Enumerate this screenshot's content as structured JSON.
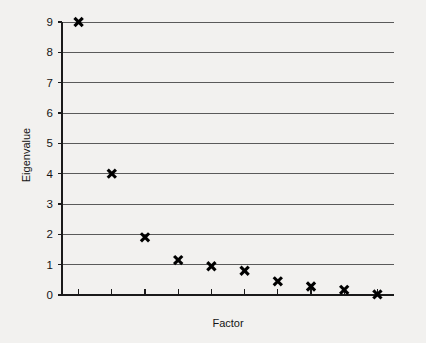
{
  "chart_data": {
    "type": "scatter",
    "title": "",
    "xlabel": "Factor",
    "ylabel": "Eigenvalue",
    "x": [
      1,
      2,
      3,
      4,
      5,
      6,
      7,
      8,
      9,
      10
    ],
    "values": [
      9.0,
      4.0,
      1.9,
      1.15,
      0.95,
      0.8,
      0.45,
      0.28,
      0.17,
      0.02
    ],
    "series": [
      {
        "name": "Eigenvalue",
        "values": [
          9.0,
          4.0,
          1.9,
          1.15,
          0.95,
          0.8,
          0.45,
          0.28,
          0.17,
          0.02
        ]
      }
    ],
    "ylim": [
      0,
      9
    ],
    "xlim": [
      0.5,
      10.5
    ],
    "ytick_labels": [
      "0",
      "1",
      "2",
      "3",
      "4",
      "5",
      "6",
      "7",
      "8",
      "9"
    ],
    "ytick_values": [
      0,
      1,
      2,
      3,
      4,
      5,
      6,
      7,
      8,
      9
    ],
    "xtick_labels": [
      "",
      "",
      "",
      "",
      "",
      "",
      "",
      "",
      "",
      ""
    ],
    "xtick_count": 10,
    "grid": "horizontal",
    "legend": "none",
    "marker_style": "x-cross",
    "marker_color": "#000000",
    "gridline_color": "#5a5a5a",
    "axis_color": "#1a1a1a",
    "background_color": "#f2f1ef"
  }
}
